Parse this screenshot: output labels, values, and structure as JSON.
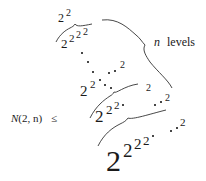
{
  "expression": {
    "lhs": {
      "func": "N",
      "args": "(2, n)",
      "relation": "≤"
    },
    "tower_label": {
      "var": "n",
      "text": "levels"
    },
    "towers": [
      {
        "base": "2",
        "exp": "2"
      },
      {
        "base": "2",
        "exps": [
          "2",
          "2",
          "2"
        ]
      },
      {
        "base": "2",
        "exps": [
          "2",
          "·",
          "·",
          "2"
        ]
      },
      {
        "base": "2",
        "exps": [
          "2",
          "2",
          "·",
          "·",
          "2"
        ]
      },
      {
        "base": "2",
        "exps": [
          "2",
          "2",
          "2",
          "·",
          "·",
          "2"
        ]
      }
    ],
    "glyphs": {
      "two": "2",
      "dot": "·"
    }
  }
}
